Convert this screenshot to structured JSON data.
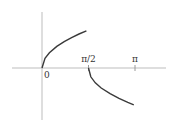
{
  "chart_data": {
    "type": "line",
    "title": "",
    "xlabel": "",
    "ylabel": "",
    "xlim": [
      -0.95,
      2.2
    ],
    "ylim": [
      -1.1,
      1.15
    ],
    "tick_labels": [
      {
        "x": 0,
        "label": "0"
      },
      {
        "x": 1.5708,
        "label": "π/2"
      },
      {
        "x": 3.1416,
        "label": "π"
      }
    ],
    "grid": false,
    "legend": "none",
    "series": [
      {
        "name": "branch-1",
        "x": [
          0,
          0.1,
          0.25,
          0.5,
          0.75,
          1.0,
          1.25,
          1.5
        ],
        "y": [
          0,
          0.24,
          0.38,
          0.54,
          0.66,
          0.76,
          0.85,
          0.93
        ]
      },
      {
        "name": "branch-2",
        "x": [
          1.5708,
          1.65,
          1.8,
          2.0,
          2.3,
          2.6,
          2.9,
          3.1
        ],
        "y": [
          0,
          -0.22,
          -0.37,
          -0.5,
          -0.64,
          -0.76,
          -0.86,
          -0.92
        ]
      }
    ]
  }
}
